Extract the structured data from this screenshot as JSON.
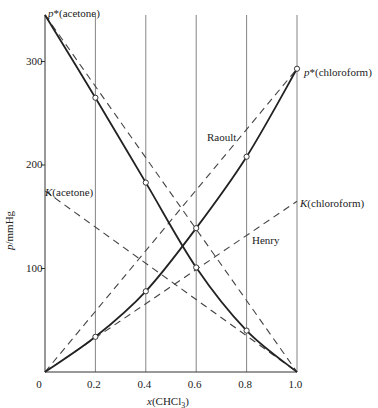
{
  "chart_data": {
    "type": "line",
    "title": "",
    "xlabel": "x(CHCl3)",
    "ylabel": "p/mmHg",
    "xlim": [
      0,
      1.0
    ],
    "ylim": [
      0,
      350
    ],
    "x_ticks": [
      "0",
      "0.2",
      "0.4",
      "0.6",
      "0.8",
      "1.0"
    ],
    "y_ticks": [
      "100",
      "200",
      "300"
    ],
    "grid": "vertical lines at x ticks",
    "series": [
      {
        "name": "acetone partial pressure (measured)",
        "style": "solid",
        "x": [
          0,
          0.2,
          0.4,
          0.6,
          0.8,
          1.0
        ],
        "y": [
          345,
          265,
          183,
          101,
          40,
          0
        ]
      },
      {
        "name": "chloroform partial pressure (measured)",
        "style": "solid",
        "x": [
          0,
          0.2,
          0.4,
          0.6,
          0.8,
          1.0
        ],
        "y": [
          0,
          34,
          78,
          139,
          208,
          293
        ]
      },
      {
        "name": "Raoult (acetone)",
        "style": "dashed",
        "x": [
          0,
          1.0
        ],
        "y": [
          345,
          0
        ]
      },
      {
        "name": "Raoult (chloroform)",
        "style": "dashed",
        "x": [
          0,
          1.0
        ],
        "y": [
          0,
          293
        ]
      },
      {
        "name": "Henry (acetone)",
        "style": "dashed",
        "x": [
          0,
          1.0
        ],
        "y": [
          175,
          0
        ]
      },
      {
        "name": "Henry (chloroform)",
        "style": "dashed",
        "x": [
          0,
          1.0
        ],
        "y": [
          0,
          165
        ]
      }
    ],
    "annotations": [
      {
        "text": "p*(acetone)",
        "x": 0,
        "y": 345
      },
      {
        "text": "p*(chloroform)",
        "x": 1.0,
        "y": 293
      },
      {
        "text": "K(acetone)",
        "x": 0,
        "y": 175
      },
      {
        "text": "K(chloroform)",
        "x": 1.0,
        "y": 165
      },
      {
        "text": "Raoult",
        "x": 0.68,
        "y": 220
      },
      {
        "text": "Henry",
        "x": 0.86,
        "y": 135
      }
    ]
  },
  "labels": {
    "p_acetone": "p*(acetone)",
    "p_chloroform": "p*(chloroform)",
    "k_acetone": "K(acetone)",
    "k_chloroform": "K(chloroform)",
    "raoult": "Raoult",
    "henry": "Henry",
    "ylabel": "p/mmHg",
    "xlabel_prefix": "x",
    "xlabel_species": "(CHCl",
    "xlabel_sub": "3",
    "xlabel_suffix": ")"
  }
}
